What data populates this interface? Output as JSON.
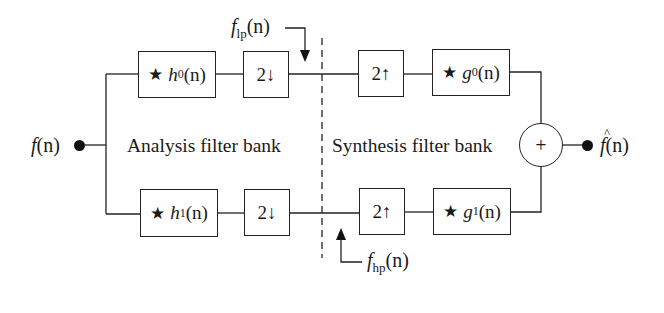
{
  "diagram": {
    "input": {
      "label_fn": "f",
      "label_arg": "(n)"
    },
    "output": {
      "label_fn": "f",
      "label_arg": "(n)",
      "hat": true
    },
    "sections": {
      "analysis": "Analysis filter bank",
      "synthesis": "Synthesis filter bank"
    },
    "analysis": {
      "top_filter": {
        "star": "★",
        "name": "h",
        "sub": "0",
        "arg": "(n)"
      },
      "top_down": "2↓",
      "bottom_filter": {
        "star": "★",
        "name": "h",
        "sub": "1",
        "arg": "(n)"
      },
      "bottom_down": "2↓"
    },
    "synthesis": {
      "top_up": "2↑",
      "top_filter": {
        "star": "★",
        "name": "g",
        "sub": "0",
        "arg": "(n)"
      },
      "bottom_up": "2↑",
      "bottom_filter": {
        "star": "★",
        "name": "g",
        "sub": "1",
        "arg": "(n)"
      }
    },
    "summer": {
      "symbol": "+"
    },
    "signals": {
      "lowpass": {
        "name": "f",
        "sub": "lp",
        "arg": "(n)"
      },
      "highpass": {
        "name": "f",
        "sub": "hp",
        "arg": "(n)"
      }
    },
    "colors": {
      "stroke": "#222222",
      "background": "#ffffff"
    }
  }
}
